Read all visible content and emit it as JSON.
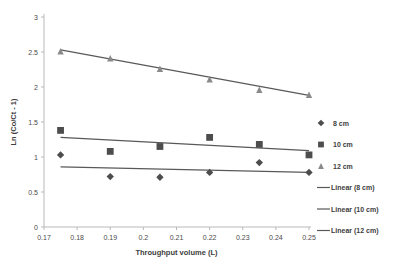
{
  "chart_data": {
    "type": "scatter",
    "title": "",
    "xlabel": "Throughput volume (L)",
    "ylabel": "Ln (Co/Ct - 1)",
    "xlim": [
      0.17,
      0.25
    ],
    "ylim": [
      0,
      3
    ],
    "xticks": [
      "0.17",
      "0.18",
      "0.19",
      "0.2",
      "0.21",
      "0.22",
      "0.23",
      "0.24",
      "0.25"
    ],
    "xtick_values": [
      0.17,
      0.18,
      0.19,
      0.2,
      0.21,
      0.22,
      0.23,
      0.24,
      0.25
    ],
    "yticks": [
      "0",
      "0.5",
      "1",
      "1.5",
      "2",
      "2.5",
      "3"
    ],
    "ytick_values": [
      0,
      0.5,
      1,
      1.5,
      2,
      2.5,
      3
    ],
    "grid": false,
    "legend_position": "right",
    "x": [
      0.175,
      0.19,
      0.205,
      0.22,
      0.235,
      0.25
    ],
    "series": [
      {
        "name": "8 cm",
        "marker": "diamond",
        "color": "#4d4d4d",
        "values": [
          1.03,
          0.72,
          0.71,
          0.78,
          0.92,
          0.78
        ]
      },
      {
        "name": "10 cm",
        "marker": "square",
        "color": "#4d4d4d",
        "values": [
          1.38,
          1.08,
          1.15,
          1.28,
          1.18,
          1.03
        ]
      },
      {
        "name": "12 cm",
        "marker": "triangle",
        "color": "#8a8a8a",
        "values": [
          2.51,
          2.41,
          2.26,
          2.11,
          1.96,
          1.89
        ]
      }
    ],
    "trendlines": [
      {
        "name": "Linear (8 cm)",
        "color": "#595959",
        "x0": 0.175,
        "y0": 0.86,
        "x1": 0.25,
        "y1": 0.78
      },
      {
        "name": "Linear (10 cm)",
        "color": "#595959",
        "x0": 0.175,
        "y0": 1.28,
        "x1": 0.25,
        "y1": 1.09
      },
      {
        "name": "Linear (12 cm)",
        "color": "#595959",
        "x0": 0.175,
        "y0": 2.53,
        "x1": 0.25,
        "y1": 1.88
      }
    ],
    "legend": [
      {
        "label": "8 cm",
        "kind": "marker",
        "marker": "diamond",
        "color": "#4d4d4d"
      },
      {
        "label": "10 cm",
        "kind": "marker",
        "marker": "square",
        "color": "#4d4d4d"
      },
      {
        "label": "12 cm",
        "kind": "marker",
        "marker": "triangle",
        "color": "#8a8a8a"
      },
      {
        "label": "Linear (8 cm)",
        "kind": "line",
        "color": "#595959"
      },
      {
        "label": "Linear (10 cm)",
        "kind": "line",
        "color": "#595959"
      },
      {
        "label": "Linear (12 cm)",
        "kind": "line",
        "color": "#595959"
      }
    ]
  },
  "colors": {
    "background": "#ffffff",
    "axis": "#b9b9b9",
    "text": "#3d3d3d",
    "series_dark": "#4d4d4d",
    "series_light": "#8a8a8a",
    "trend": "#595959"
  }
}
